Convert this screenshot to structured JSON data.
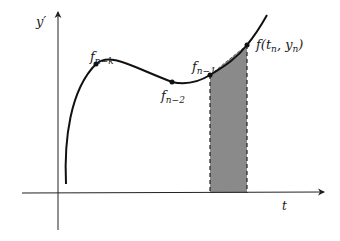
{
  "diagram": {
    "axes": {
      "y_label": "y′",
      "x_label": "t"
    },
    "points": [
      {
        "id": "fnk",
        "label_main": "f",
        "label_sub": "n−k"
      },
      {
        "id": "fn2",
        "label_main": "f",
        "label_sub": "n−2"
      },
      {
        "id": "fn1",
        "label_main": "f",
        "label_sub": "n−1"
      },
      {
        "id": "fn",
        "label_main": "f(t",
        "label_sub": "n",
        "label_mid": ", y",
        "label_sub2": "n",
        "label_end": ")"
      }
    ],
    "colors": {
      "curve": "#111111",
      "axis": "#222222",
      "shade": "#8a8a8a",
      "background": "#ffffff"
    }
  }
}
